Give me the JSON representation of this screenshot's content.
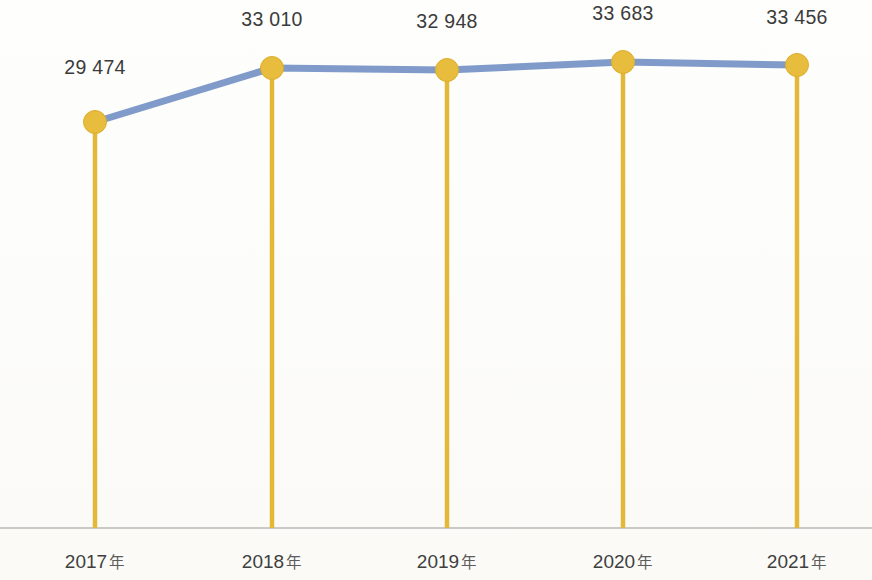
{
  "chart_data": {
    "type": "line",
    "title": "",
    "subtitle": "",
    "xlabel": "",
    "ylabel": "",
    "categories": [
      "2017年",
      "2018年",
      "2019年",
      "2020年",
      "2021年"
    ],
    "category_numbers": [
      "2017",
      "2018",
      "2019",
      "2020",
      "2021"
    ],
    "category_suffix": "年",
    "values": [
      29474,
      33010,
      32948,
      33683,
      33456
    ],
    "value_labels": [
      "29 474",
      "33 010",
      "32 948",
      "33 683",
      "33 456"
    ],
    "series": [
      {
        "name": "",
        "values": [
          29474,
          33010,
          32948,
          33683,
          33456
        ]
      }
    ],
    "ylim": [
      0,
      36000
    ],
    "grid": false,
    "legend": false,
    "legend_position": "none",
    "thousands_separator": " ",
    "marker_shape": "circle",
    "has_drop_lines": true,
    "baseline_visible": true,
    "annotations": []
  },
  "style": {
    "line_color": "#7593c4",
    "marker_color": "#e8bc3c",
    "marker_edge_color": "#dcae2c",
    "stem_color": "#e3b838",
    "baseline_color": "#b9b9b4",
    "label_color": "#3b3b3b",
    "category_label_color": "#3f3f3f",
    "background_color": "#fdfdfb"
  },
  "geometry": {
    "baseline_y": 528,
    "points": [
      {
        "x": 95,
        "y": 122,
        "label_x": 95,
        "label_y": 56
      },
      {
        "x": 272,
        "y": 68,
        "label_x": 272,
        "label_y": 8
      },
      {
        "x": 447,
        "y": 70,
        "label_x": 447,
        "label_y": 10
      },
      {
        "x": 623,
        "y": 62,
        "label_x": 623,
        "label_y": 2
      },
      {
        "x": 797,
        "y": 65,
        "label_x": 797,
        "label_y": 6
      }
    ],
    "category_label_y": 550,
    "marker_radius": 11.5,
    "line_width": 7,
    "stem_width": 4.5
  }
}
